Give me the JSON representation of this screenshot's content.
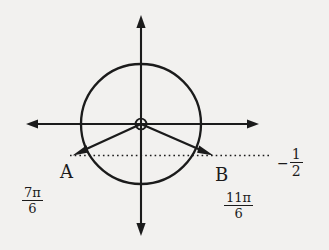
{
  "figure": {
    "background_color": "#f2f1ef",
    "ink_color": "#1b1b1b",
    "center": {
      "x": 141,
      "y": 124
    },
    "radius": 60
  },
  "axes": {
    "x_axis": {
      "x1": 26,
      "y1": 124,
      "x2": 258,
      "y2": 124,
      "arrow_both_ends": true
    },
    "y_axis": {
      "x1": 141,
      "y1": 16,
      "x2": 141,
      "y2": 234,
      "arrow_both_ends": true
    },
    "origin_marker": "open-circle"
  },
  "circle": {
    "cx": 141,
    "cy": 124,
    "r": 60,
    "stroke_width": 2.2,
    "fill": "none"
  },
  "rays": [
    {
      "name": "ray-to-a",
      "from": {
        "x": 141,
        "y": 124
      },
      "to": {
        "x": 75,
        "y": 154
      },
      "arrow_head": "end"
    },
    {
      "name": "ray-to-b",
      "from": {
        "x": 141,
        "y": 124
      },
      "to": {
        "x": 211,
        "y": 154
      },
      "arrow_head": "end"
    }
  ],
  "dotted_line": {
    "name": "y-equals-negative-one-half",
    "x1": 72,
    "y1": 155,
    "x2": 268,
    "y2": 155,
    "style": "dotted"
  },
  "labels": {
    "point_a": "A",
    "point_b": "B",
    "angle_a": {
      "numerator": "7π",
      "denominator": "6"
    },
    "angle_b": {
      "numerator": "11π",
      "denominator": "6"
    },
    "value": {
      "sign": "−",
      "numerator": "1",
      "denominator": "2"
    }
  }
}
